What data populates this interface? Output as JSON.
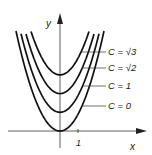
{
  "diagram": {
    "x_axis_label": "x",
    "y_axis_label": "y",
    "tick_label": "1",
    "curves": [
      {
        "label": "C = 0",
        "offset": 0
      },
      {
        "label": "C = 1",
        "offset": 1
      },
      {
        "label": "C = √2",
        "offset": 2
      },
      {
        "label": "C = √3",
        "offset": 3
      }
    ]
  }
}
